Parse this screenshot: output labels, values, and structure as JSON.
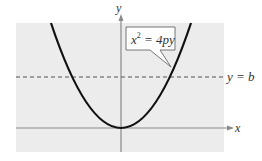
{
  "figure": {
    "equation_label": {
      "lhs": "x",
      "exp": "2",
      "rhs": " = 4py"
    },
    "line_label": "y = b",
    "x_axis_label": "x",
    "y_axis_label": "y",
    "colors": {
      "background": "#ececec",
      "curve": "#111111",
      "axis": "#8a8a8a",
      "dashed": "#555555",
      "label_box": "#ffffff"
    }
  }
}
